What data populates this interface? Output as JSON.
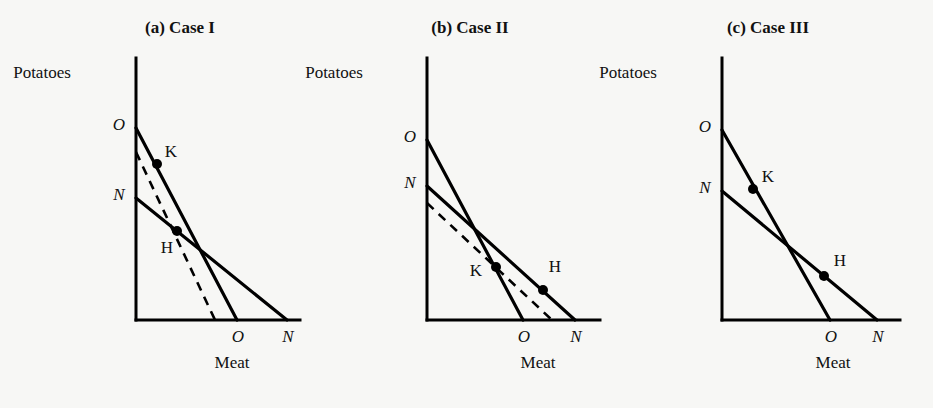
{
  "figure": {
    "background": "#f7f7f5",
    "ink": "#000000",
    "width": 933,
    "height": 408
  },
  "chart_data": {
    "type": "line",
    "title": "",
    "xlabel": "Meat",
    "ylabel": "Potatoes",
    "grid": false,
    "legend": "none",
    "panels": [
      {
        "id": "case-1",
        "title": "(a)  Case I",
        "xlabel": "Meat",
        "ylabel": "Potatoes",
        "y_intercept_labels": [
          "O",
          "N"
        ],
        "x_intercept_labels": [
          "O",
          "N"
        ],
        "lines": [
          {
            "name": "line-O",
            "style": "solid",
            "y_intercept_label": "O",
            "x_intercept_label": "O",
            "y_intercept_px": 128,
            "x_intercept_px": 237
          },
          {
            "name": "line-N",
            "style": "solid",
            "y_intercept_label": "N",
            "x_intercept_label": "N",
            "y_intercept_px": 198,
            "x_intercept_px": 287
          },
          {
            "name": "line-compensated-dashed",
            "style": "dashed",
            "y_intercept_label": "",
            "x_intercept_label": "",
            "y_intercept_px": 152,
            "x_intercept_px": 215
          }
        ],
        "points": [
          {
            "label": "K",
            "on_line": "line-O",
            "x_px": 157,
            "y_px": 164,
            "label_dx": 14,
            "label_dy": -7
          },
          {
            "label": "H",
            "on_line": "line-N",
            "x_px": 177,
            "y_px": 231,
            "label_dx": -10,
            "label_dy": 22
          }
        ]
      },
      {
        "id": "case-2",
        "title": "(b)  Case II",
        "xlabel": "Meat",
        "ylabel": "Potatoes",
        "y_intercept_labels": [
          "O",
          "N"
        ],
        "x_intercept_labels": [
          "O",
          "N"
        ],
        "lines": [
          {
            "name": "line-O",
            "style": "solid",
            "y_intercept_label": "O",
            "x_intercept_label": "O",
            "y_intercept_px": 140,
            "x_intercept_px": 523
          },
          {
            "name": "line-N",
            "style": "solid",
            "y_intercept_label": "N",
            "x_intercept_label": "N",
            "y_intercept_px": 186,
            "x_intercept_px": 575
          },
          {
            "name": "line-compensated-dashed",
            "style": "dashed",
            "y_intercept_label": "",
            "x_intercept_label": "",
            "y_intercept_px": 203,
            "x_intercept_px": 552
          }
        ],
        "points": [
          {
            "label": "K",
            "on_line": "line-O",
            "x_px": 496,
            "y_px": 267,
            "label_dx": -20,
            "label_dy": 9
          },
          {
            "label": "H",
            "on_line": "line-N",
            "x_px": 543,
            "y_px": 290,
            "label_dx": 12,
            "label_dy": -18
          }
        ]
      },
      {
        "id": "case-3",
        "title": "(c)  Case III",
        "xlabel": "Meat",
        "ylabel": "Potatoes",
        "y_intercept_labels": [
          "O",
          "N"
        ],
        "x_intercept_labels": [
          "O",
          "N"
        ],
        "lines": [
          {
            "name": "line-O",
            "style": "solid",
            "y_intercept_label": "O",
            "x_intercept_label": "O",
            "y_intercept_px": 130,
            "x_intercept_px": 830
          },
          {
            "name": "line-N",
            "style": "solid",
            "y_intercept_label": "N",
            "x_intercept_label": "N",
            "y_intercept_px": 191,
            "x_intercept_px": 877
          }
        ],
        "points": [
          {
            "label": "K",
            "on_line": "line-O",
            "x_px": 753,
            "y_px": 189,
            "label_dx": 15,
            "label_dy": -7
          },
          {
            "label": "H",
            "on_line": "line-N",
            "x_px": 824,
            "y_px": 276,
            "label_dx": 16,
            "label_dy": -10
          }
        ]
      }
    ]
  },
  "panel_geometry": [
    {
      "id": "case-1",
      "origin_x": 136,
      "origin_y": 320,
      "y_axis_top": 58,
      "x_axis_right": 300,
      "title_x": 180,
      "title_y": 33,
      "ylabel_x": 42,
      "ylabel_y": 78,
      "xlabel_x": 232,
      "xlabel_y": 368
    },
    {
      "id": "case-2",
      "origin_x": 427,
      "origin_y": 320,
      "y_axis_top": 58,
      "x_axis_right": 600,
      "title_x": 470,
      "title_y": 33,
      "ylabel_x": 334,
      "ylabel_y": 78,
      "xlabel_x": 538,
      "xlabel_y": 368
    },
    {
      "id": "case-3",
      "origin_x": 722,
      "origin_y": 320,
      "y_axis_top": 58,
      "x_axis_right": 900,
      "title_x": 768,
      "title_y": 33,
      "ylabel_x": 628,
      "ylabel_y": 78,
      "xlabel_x": 833,
      "xlabel_y": 368
    }
  ]
}
